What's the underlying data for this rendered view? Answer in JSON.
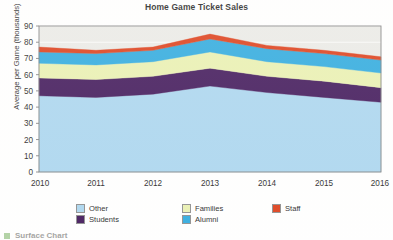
{
  "chart_data": {
    "type": "area",
    "title": "Home Game Ticket Sales",
    "xlabel": "",
    "ylabel": "Average per Game (thousands)",
    "x": [
      "2010",
      "2011",
      "2012",
      "2013",
      "2014",
      "2015",
      "2016"
    ],
    "categories": [
      "2010",
      "2011",
      "2012",
      "2013",
      "2014",
      "2015",
      "2016"
    ],
    "ylim": [
      0,
      90
    ],
    "yticks": [
      0,
      10,
      20,
      30,
      40,
      50,
      60,
      70,
      80,
      90
    ],
    "ytick_labels": [
      "0",
      "10",
      "20",
      "30",
      "40",
      "50",
      "60",
      "70",
      "80",
      "90"
    ],
    "grid": true,
    "stacked": true,
    "legend_position": "bottom",
    "legend_order": [
      "Other",
      "Students",
      "Families",
      "Alumni",
      "Staff"
    ],
    "series": [
      {
        "name": "Other",
        "color": "#A9D5EF",
        "values": [
          47,
          46,
          48,
          53,
          49,
          46,
          43
        ]
      },
      {
        "name": "Students",
        "color": "#3B1055",
        "values": [
          11,
          11,
          11,
          11,
          10,
          10,
          9
        ]
      },
      {
        "name": "Families",
        "color": "#E9F0AF",
        "values": [
          9,
          9,
          9,
          10,
          9,
          9,
          9
        ]
      },
      {
        "name": "Alumni",
        "color": "#29A8DE",
        "values": [
          7,
          7,
          7,
          8,
          8,
          8,
          8
        ]
      },
      {
        "name": "Staff",
        "color": "#DC3812",
        "values": [
          3,
          2,
          2,
          3,
          2,
          2,
          2
        ]
      }
    ],
    "cumulative_tops": {
      "Other": [
        47,
        46,
        48,
        53,
        49,
        46,
        43
      ],
      "Students": [
        58,
        57,
        59,
        64,
        59,
        56,
        52
      ],
      "Families": [
        67,
        66,
        68,
        74,
        68,
        65,
        61
      ],
      "Alumni": [
        74,
        73,
        75,
        82,
        76,
        73,
        69
      ],
      "Staff": [
        77,
        75,
        77,
        85,
        78,
        75,
        71
      ]
    },
    "plot_background": "#EAEAE6",
    "grid_color": "#FFFFFF",
    "axis_color": "#7A7A7A"
  },
  "legend": {
    "items": [
      {
        "label": "Other",
        "color": "#A9D5EF"
      },
      {
        "label": "Families",
        "color": "#E9F0AF"
      },
      {
        "label": "Staff",
        "color": "#DC3812"
      },
      {
        "label": "Students",
        "color": "#3B1055"
      },
      {
        "label": "Alumni",
        "color": "#29A8DE"
      }
    ]
  },
  "footer": {
    "note": "Surface Chart"
  }
}
